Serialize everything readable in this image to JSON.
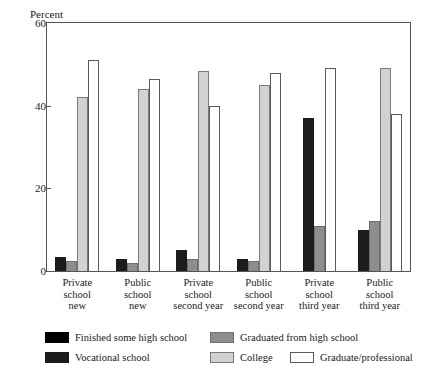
{
  "chart_data": {
    "type": "bar",
    "title": "",
    "xlabel": "",
    "ylabel": "Percent",
    "ylim": [
      0,
      60
    ],
    "yticks": [
      0,
      20,
      40,
      60
    ],
    "grid": false,
    "legend_position": "bottom",
    "categories": [
      "Private school new",
      "Public school new",
      "Private school second year",
      "Public school second year",
      "Private school third year",
      "Public school third year"
    ],
    "category_lines": [
      [
        "Private",
        "school",
        "new"
      ],
      [
        "Public",
        "school",
        "new"
      ],
      [
        "Private",
        "school",
        "second year"
      ],
      [
        "Public",
        "school",
        "second year"
      ],
      [
        "Private",
        "school",
        "third year"
      ],
      [
        "Public",
        "school",
        "third year"
      ]
    ],
    "series": [
      {
        "name": "Finished some high school",
        "color": "#000000",
        "values": [
          0,
          0,
          0,
          0,
          0,
          0
        ]
      },
      {
        "name": "Vocational school",
        "color": "#1c1c1c",
        "values": [
          3.5,
          3,
          5,
          3,
          37,
          10
        ]
      },
      {
        "name": "Graduated from  high school",
        "color": "#8e8e8e",
        "values": [
          2.5,
          2,
          3,
          2.5,
          11,
          12
        ]
      },
      {
        "name": "College",
        "color": "#d2d2d2",
        "values": [
          42,
          44,
          48.5,
          45,
          0,
          49
        ]
      },
      {
        "name": "Graduate/professional",
        "color": "#ffffff",
        "values": [
          51,
          46.5,
          40,
          48,
          49,
          38
        ]
      }
    ]
  },
  "legend": {
    "items": [
      {
        "label": "Finished some high school",
        "swatch": "s0"
      },
      {
        "label": "Graduated from  high school",
        "swatch": "s2"
      },
      {
        "label": "Vocational school",
        "swatch": "s1"
      },
      {
        "label": "College",
        "swatch": "s3"
      },
      {
        "label": "Graduate/professional",
        "swatch": "s4"
      }
    ]
  }
}
